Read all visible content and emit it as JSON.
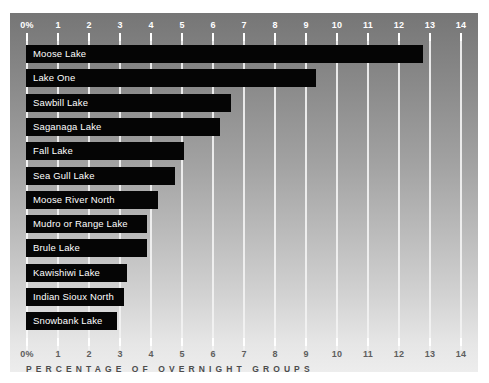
{
  "chart_data": {
    "type": "bar",
    "orientation": "horizontal",
    "title": "",
    "subtitle": "",
    "xlabel": "PERCENTAGE OF OVERNIGHT GROUPS",
    "ylabel": "",
    "xlim": [
      0,
      14
    ],
    "grid": true,
    "legend": null,
    "xticks": [
      "0%",
      "1",
      "2",
      "3",
      "4",
      "5",
      "6",
      "7",
      "8",
      "9",
      "10",
      "11",
      "12",
      "13",
      "14"
    ],
    "xtick_values": [
      0,
      1,
      2,
      3,
      4,
      5,
      6,
      7,
      8,
      9,
      10,
      11,
      12,
      13,
      14
    ],
    "categories": [
      "Moose Lake",
      "Lake One",
      "Sawbill Lake",
      "Saganaga Lake",
      "Fall Lake",
      "Sea Gull Lake",
      "Moose River North",
      "Mudro or Range Lake",
      "Brule Lake",
      "Kawishiwi Lake",
      "Indian Sioux North",
      "Snowbank Lake"
    ],
    "values": [
      12.8,
      9.35,
      6.6,
      6.25,
      5.1,
      4.8,
      4.25,
      3.9,
      3.9,
      3.25,
      3.15,
      2.95
    ],
    "bar_color": "#050505",
    "label_color": "#ffffff",
    "gridline_color": "#f2f2f2",
    "panel_gradient_top": "#767676",
    "panel_gradient_bottom": "#ededed",
    "page_background": "#ffffff"
  },
  "axis": {
    "top_ticks": [
      "0%",
      "1",
      "2",
      "3",
      "4",
      "5",
      "6",
      "7",
      "8",
      "9",
      "10",
      "11",
      "12",
      "13",
      "14"
    ],
    "bottom_ticks": [
      "0%",
      "1",
      "2",
      "3",
      "4",
      "5",
      "6",
      "7",
      "8",
      "9",
      "10",
      "11",
      "12",
      "13",
      "14"
    ],
    "caption": "PERCENTAGE OF OVERNIGHT GROUPS"
  }
}
